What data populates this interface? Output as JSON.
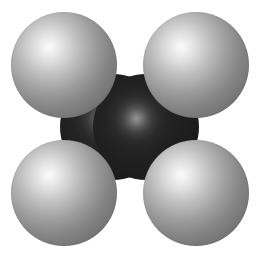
{
  "figure": {
    "molecule_name": "Ethylene",
    "molecular_formula": "C2H4",
    "background_color": "#ffffff",
    "render_style": "CPK space-filling",
    "canvas": {
      "width": 259,
      "height": 254
    }
  },
  "palette": {
    "hydrogen_base": "#6a6a6a",
    "hydrogen_highlight": "#fbfbfb",
    "carbon_base": "#191919",
    "carbon_highlight": "#949494",
    "background": "#ffffff"
  },
  "atoms": [
    {
      "id": "c-left",
      "element": "C",
      "element_name": "Carbon",
      "label": "carbon-left",
      "radius_px": 53,
      "center": {
        "x": 113,
        "y": 127
      },
      "color": "#191919",
      "layer": "back"
    },
    {
      "id": "c-right",
      "element": "C",
      "element_name": "Carbon",
      "label": "carbon-right",
      "radius_px": 53,
      "center": {
        "x": 146,
        "y": 127
      },
      "color": "#191919",
      "layer": "back"
    },
    {
      "id": "h-tl",
      "element": "H",
      "element_name": "Hydrogen",
      "label": "hydrogen-top-left",
      "radius_px": 53,
      "center": {
        "x": 64,
        "y": 65
      },
      "color": "#6a6a6a",
      "layer": "front"
    },
    {
      "id": "h-tr",
      "element": "H",
      "element_name": "Hydrogen",
      "label": "hydrogen-top-right",
      "radius_px": 53,
      "center": {
        "x": 196,
        "y": 65
      },
      "color": "#6a6a6a",
      "layer": "front"
    },
    {
      "id": "h-bl",
      "element": "H",
      "element_name": "Hydrogen",
      "label": "hydrogen-bottom-left",
      "radius_px": 53,
      "center": {
        "x": 64,
        "y": 193
      },
      "color": "#6a6a6a",
      "layer": "front"
    },
    {
      "id": "h-br",
      "element": "H",
      "element_name": "Hydrogen",
      "label": "hydrogen-bottom-right",
      "radius_px": 53,
      "center": {
        "x": 196,
        "y": 193
      },
      "color": "#6a6a6a",
      "layer": "front"
    }
  ],
  "bonds": [
    {
      "from": "c-left",
      "to": "c-right",
      "order": 2,
      "label": "C=C double bond"
    },
    {
      "from": "c-left",
      "to": "h-tl",
      "order": 1,
      "label": "C-H"
    },
    {
      "from": "c-left",
      "to": "h-bl",
      "order": 1,
      "label": "C-H"
    },
    {
      "from": "c-right",
      "to": "h-tr",
      "order": 1,
      "label": "C-H"
    },
    {
      "from": "c-right",
      "to": "h-br",
      "order": 1,
      "label": "C-H"
    }
  ]
}
